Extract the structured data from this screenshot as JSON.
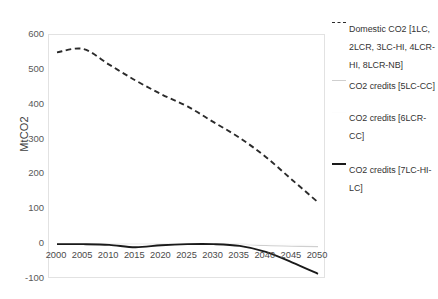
{
  "chart_data": {
    "type": "line",
    "title": "",
    "xlabel": "",
    "ylabel": "MtCO2",
    "xlim": [
      2000,
      2050
    ],
    "ylim": [
      -100,
      600
    ],
    "ytick_labels": [
      "600",
      "500",
      "400",
      "300",
      "200",
      "100",
      "0",
      "-100"
    ],
    "ytick_values": [
      600,
      500,
      400,
      300,
      200,
      100,
      0,
      -100
    ],
    "xtick_labels": [
      "2000",
      "2005",
      "2010",
      "2015",
      "2020",
      "2025",
      "2030",
      "2035",
      "2040",
      "2045",
      "2050"
    ],
    "x": [
      2000,
      2005,
      2010,
      2015,
      2020,
      2025,
      2030,
      2035,
      2040,
      2045,
      2050
    ],
    "grid": false,
    "legend_position": "right",
    "series": [
      {
        "name": "Domestic CO2 [1LC, 2LCR, 3LC-HI, 4LCR-HI, 8LCR-NB]",
        "style": "dashed",
        "color": "#2b2b2b",
        "values": [
          550,
          560,
          515,
          470,
          430,
          395,
          350,
          305,
          250,
          185,
          120
        ]
      },
      {
        "name": "CO2 credits [5LC-CC]",
        "style": "solid-light",
        "color": "#cfcfcf",
        "values": [
          0,
          0,
          0,
          0,
          0,
          0,
          0,
          0,
          -4,
          -6,
          -7
        ]
      },
      {
        "name": "CO2 credits [6LCR-CC]",
        "style": "solid-faint",
        "color": "#fdfdfd",
        "values": [
          0,
          0,
          0,
          0,
          0,
          0,
          0,
          0,
          0,
          0,
          0
        ]
      },
      {
        "name": "CO2 credits [7LC-HI-LC]",
        "style": "solid-dark",
        "color": "#1a1a1a",
        "values": [
          0,
          0,
          -2,
          -9,
          -3,
          0,
          0,
          -5,
          -22,
          -52,
          -85
        ]
      }
    ]
  },
  "axis": {
    "y_title": "MtCO2"
  },
  "legend": {
    "items": [
      {
        "label": "Domestic CO2 [1LC, 2LCR, 3LC-HI, 4LCR-HI, 8LCR-NB]",
        "marker": "dashed"
      },
      {
        "label": "CO2 credits [5LC-CC]",
        "marker": "light"
      },
      {
        "label": "CO2 credits [6LCR-CC]",
        "marker": "faint"
      },
      {
        "label": "CO2 credits [7LC-HI-LC]",
        "marker": "solid"
      }
    ]
  }
}
